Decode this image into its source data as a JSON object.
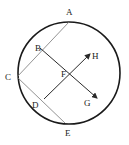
{
  "diagram": {
    "type": "geometry-circle-with-chords-and-arrows",
    "colors": {
      "circle": "#1a1a1a",
      "chord": "#777777",
      "arrow": "#2a2a2a",
      "label": "#222222",
      "background": "#ffffff"
    },
    "circle": {
      "cx": 69,
      "cy": 73,
      "r": 51
    },
    "points": {
      "A": {
        "label": "A",
        "x": 69,
        "y": 22,
        "label_x": 66,
        "label_y": 15
      },
      "B": {
        "label": "B",
        "x": 40,
        "y": 48,
        "label_x": 35,
        "label_y": 50
      },
      "C": {
        "label": "C",
        "x": 17,
        "y": 77,
        "label_x": 5,
        "label_y": 80
      },
      "D": {
        "label": "D",
        "x": 44,
        "y": 99,
        "label_x": 32,
        "label_y": 107
      },
      "E": {
        "label": "E",
        "x": 65,
        "y": 123,
        "label_x": 65,
        "label_y": 135
      },
      "F": {
        "label": "F",
        "x": 69,
        "y": 74,
        "label_x": 61,
        "label_y": 77
      },
      "G": {
        "label": "G",
        "x": 98,
        "y": 99,
        "label_x": 85,
        "label_y": 105
      },
      "H": {
        "label": "H",
        "x": 91,
        "y": 53,
        "label_x": 92,
        "label_y": 59
      }
    },
    "segments": [
      {
        "name": "chord-AC",
        "from": "A",
        "to": "C",
        "style": "thin"
      },
      {
        "name": "chord-CE",
        "from": "C",
        "to": "E",
        "style": "thin"
      }
    ],
    "arrows": [
      {
        "name": "arrow-BG",
        "from": "B",
        "to": "G",
        "passes_through": "F"
      },
      {
        "name": "arrow-DH",
        "from": "D",
        "to": "H",
        "passes_through": "F"
      }
    ]
  }
}
